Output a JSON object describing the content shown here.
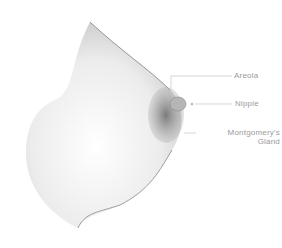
{
  "diagram": {
    "labels": [
      {
        "text": "Areola"
      },
      {
        "text": "Nipple"
      },
      {
        "text": "Montgomery's",
        "text2": "Gland"
      }
    ],
    "colors": {
      "line": "#bdbdbd",
      "label": "#9a9a9a",
      "shade_light": "#e6e6e6",
      "shade_dark": "#6e6e6e"
    }
  }
}
